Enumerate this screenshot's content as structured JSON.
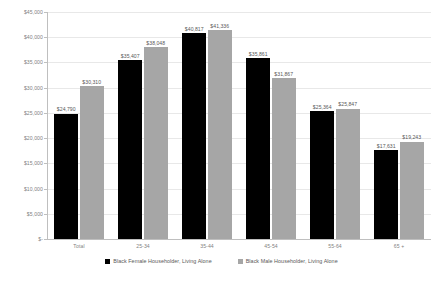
{
  "chart_data": {
    "type": "bar",
    "title": "",
    "xlabel": "",
    "ylabel": "",
    "ylim": [
      0,
      45000
    ],
    "grid": true,
    "legend_position": "bottom",
    "categories": [
      "Total",
      "25-34",
      "35-44",
      "45-54",
      "55-64",
      "65 +"
    ],
    "ytick_labels": [
      "$-",
      "$5,000",
      "$10,000",
      "$15,000",
      "$20,000",
      "$25,000",
      "$30,000",
      "$35,000",
      "$40,000",
      "$45,000"
    ],
    "ytick_values": [
      0,
      5000,
      10000,
      15000,
      20000,
      25000,
      30000,
      35000,
      40000,
      45000
    ],
    "series": [
      {
        "name": "Black Female Householder, Living Alone",
        "color": "#000000",
        "values": [
          24790,
          35407,
          40817,
          35861,
          25364,
          17631
        ],
        "labels": [
          "$24,790",
          "$35,407",
          "$40,817",
          "$35,861",
          "$25,364",
          "$17,631"
        ]
      },
      {
        "name": "Black Male Householder, Living Alone",
        "color": "#a6a6a6",
        "values": [
          30310,
          38048,
          41336,
          31867,
          25847,
          19243
        ],
        "labels": [
          "$30,310",
          "$38,048",
          "$41,336",
          "$31,867",
          "$25,847",
          "$19,243"
        ]
      }
    ]
  }
}
